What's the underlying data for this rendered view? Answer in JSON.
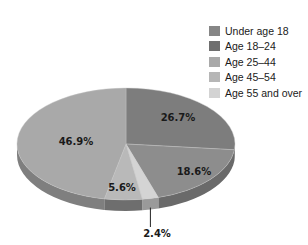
{
  "chart_data": {
    "type": "pie",
    "style": "3d-tilted",
    "title": "",
    "categories": [
      "Under age 18",
      "Age 18–24",
      "Age 25–44",
      "Age 45–54",
      "Age 55 and over"
    ],
    "values": [
      26.7,
      18.6,
      46.9,
      5.6,
      2.4
    ],
    "value_labels": [
      "26.7%",
      "18.6%",
      "46.9%",
      "5.6%",
      "2.4%"
    ],
    "colors": [
      "#868686",
      "#6f6f6f",
      "#a9a9a9",
      "#b6b6b6",
      "#d3d3d3"
    ],
    "slice_order_clockwise_from_top": [
      "Under age 18",
      "Age 18–24",
      "Age 55 and over",
      "Age 45–54",
      "Age 25–44"
    ],
    "legend_position": "top-right"
  },
  "legend": {
    "items": [
      {
        "label": "Under age 18",
        "color": "#868686"
      },
      {
        "label": "Age 18–24",
        "color": "#6f6f6f"
      },
      {
        "label": "Age 25–44",
        "color": "#a9a9a9"
      },
      {
        "label": "Age 45–54",
        "color": "#b6b6b6"
      },
      {
        "label": "Age 55 and over",
        "color": "#d3d3d3"
      }
    ]
  },
  "slices": [
    {
      "label": "Under age 18",
      "value": 26.7,
      "text": "26.7%",
      "top": "#7d7d7d",
      "side": "#5f5f5f",
      "lx": 178,
      "ly": 121
    },
    {
      "label": "Age 18–24",
      "value": 18.6,
      "text": "18.6%",
      "top": "#8d8d8d",
      "side": "#6a6a6a",
      "lx": 194,
      "ly": 175
    },
    {
      "label": "Age 55 and over",
      "value": 2.4,
      "text": "2.4%",
      "top": "#d4d4d4",
      "side": "#9a9a9a",
      "lx": 157,
      "ly": 237,
      "leader": true
    },
    {
      "label": "Age 45–54",
      "value": 5.6,
      "text": "5.6%",
      "top": "#b9b9b9",
      "side": "#6e6e6e",
      "lx": 122,
      "ly": 191
    },
    {
      "label": "Age 25–44",
      "value": 46.9,
      "text": "46.9%",
      "top": "#a9a9a9",
      "side": "#7f7f7f",
      "lx": 76,
      "ly": 145
    }
  ]
}
